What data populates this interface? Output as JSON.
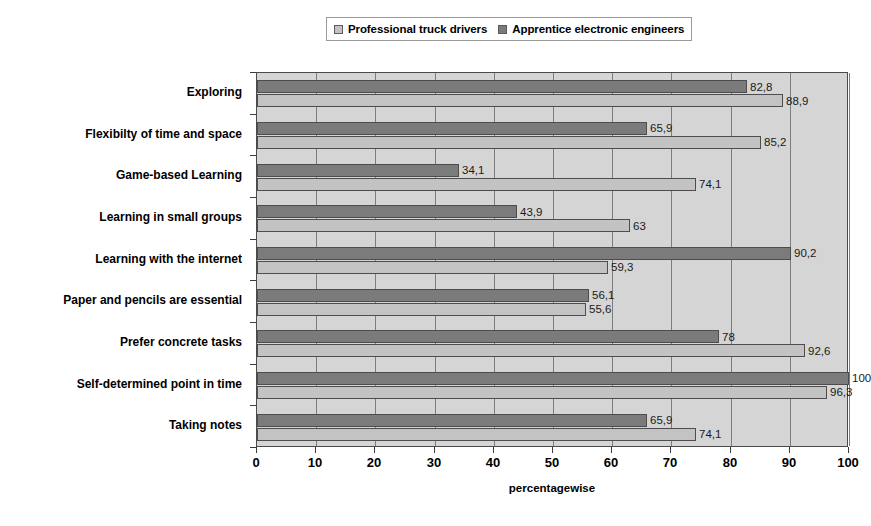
{
  "chart_data": {
    "type": "bar",
    "orientation": "horizontal",
    "title": "",
    "subtitle": "",
    "xlabel": "percentagewise",
    "ylabel": "",
    "xlim": [
      0,
      100
    ],
    "xticks": [
      0,
      10,
      20,
      30,
      40,
      50,
      60,
      70,
      80,
      90,
      100
    ],
    "grid": true,
    "grid_axis": "x",
    "legend_position": "top-center",
    "categories": [
      "Exploring",
      "Flexibilty of time and space",
      "Game-based Learning",
      "Learning in small groups",
      "Learning with the internet",
      "Paper and pencils are essential",
      "Prefer concrete tasks",
      "Self-determined point in time",
      "Taking notes"
    ],
    "series": [
      {
        "name": "Professional truck drivers",
        "color": "#c3c3c3",
        "values": [
          88.9,
          85.2,
          74.1,
          63,
          59.3,
          55.6,
          92.6,
          96.3,
          74.1
        ],
        "labels": [
          "88,9",
          "85,2",
          "74,1",
          "63",
          "59,3",
          "55,6",
          "92,6",
          "96,3",
          "74,1"
        ]
      },
      {
        "name": "Apprentice electronic engineers",
        "color": "#7b7b7b",
        "values": [
          82.8,
          65.9,
          34.1,
          43.9,
          90.2,
          56.1,
          78,
          100,
          65.9
        ],
        "labels": [
          "82,8",
          "65,9",
          "34,1",
          "43,9",
          "90,2",
          "56,1",
          "78",
          "100",
          "65,9"
        ]
      }
    ]
  },
  "legend": {
    "entries": [
      {
        "label": "Professional truck drivers",
        "swatch": "series-light"
      },
      {
        "label": "Apprentice electronic engineers",
        "swatch": "series-dark"
      }
    ]
  },
  "colors": {
    "plot_background": "#d5d5d5",
    "gridline": "#7d7d7d",
    "axis": "#3b3b3b",
    "series_light": "#c3c3c3",
    "series_dark": "#7b7b7b",
    "page_background": "#ffffff"
  }
}
